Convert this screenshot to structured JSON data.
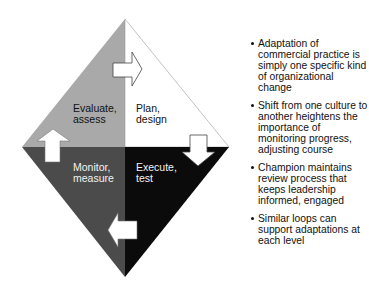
{
  "diagram": {
    "quadrants": [
      {
        "id": "evaluate",
        "label": "Evaluate,\nassess",
        "color": "#a9a9a9",
        "text_color": "#111111"
      },
      {
        "id": "plan",
        "label": "Plan,\ndesign",
        "color": "#ffffff",
        "text_color": "#111111"
      },
      {
        "id": "monitor",
        "label": "Monitor,\nmeasure",
        "color": "#4b4b4b",
        "text_color": "#f2f2f2"
      },
      {
        "id": "execute",
        "label": "Execute,\ntest",
        "color": "#0b0b0b",
        "text_color": "#f2f2f2"
      }
    ],
    "arrows": [
      "right",
      "down",
      "left",
      "up"
    ]
  },
  "bullets": [
    {
      "text": "Adaptation of commercial practice is simply one specific kind of organizational change"
    },
    {
      "text": "Shift from one culture to another heightens the importance of monitoring progress, adjusting course"
    },
    {
      "text": "Champion maintains review process that keeps leadership informed, engaged"
    },
    {
      "text": "Similar loops can support adaptations at each level"
    }
  ]
}
